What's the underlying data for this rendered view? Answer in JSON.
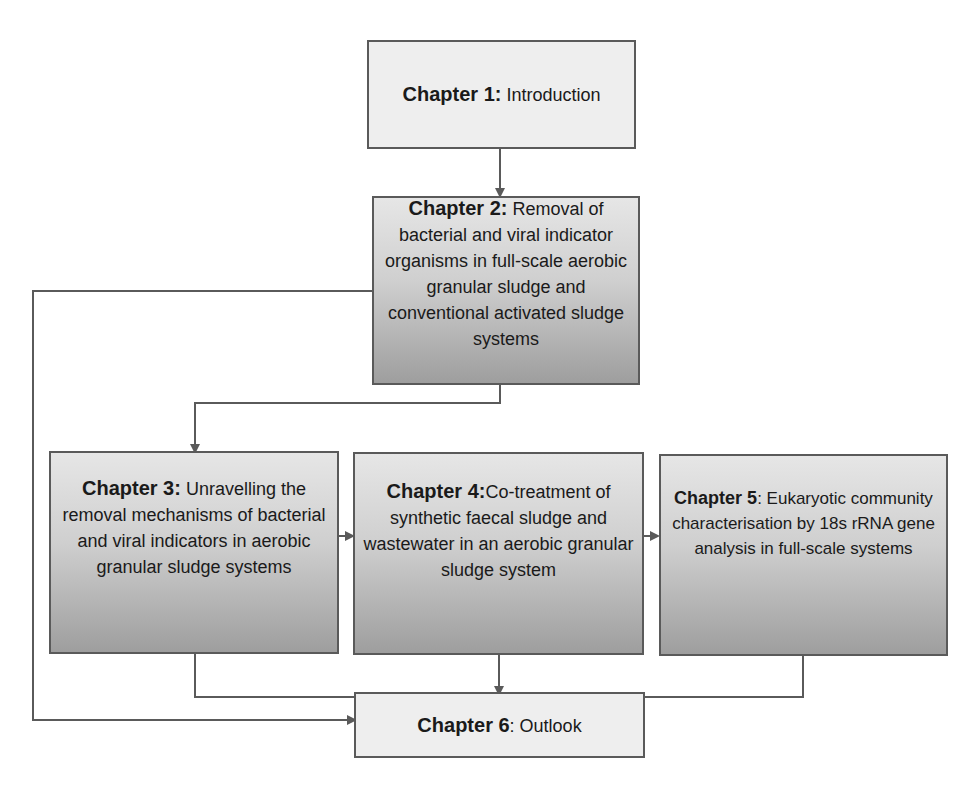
{
  "diagram": {
    "type": "flowchart",
    "nodes": [
      {
        "id": "ch1",
        "title": "Chapter 1:",
        "text": " Introduction"
      },
      {
        "id": "ch2",
        "title": "Chapter 2:",
        "text": " Removal of bacterial and viral indicator organisms in full-scale aerobic granular sludge and conventional activated sludge systems"
      },
      {
        "id": "ch3",
        "title": "Chapter 3:",
        "text": " Unravelling the removal mechanisms of bacterial and viral indicators in aerobic granular sludge systems"
      },
      {
        "id": "ch4",
        "title": "Chapter 4:",
        "text": "Co-treatment of synthetic faecal sludge and wastewater in an aerobic granular sludge system"
      },
      {
        "id": "ch5",
        "title": "Chapter 5",
        "text": ": Eukaryotic community characterisation by 18s rRNA gene analysis in full-scale systems"
      },
      {
        "id": "ch6",
        "title": "Chapter 6",
        "text": ": Outlook"
      }
    ],
    "edges": [
      {
        "from": "ch1",
        "to": "ch2"
      },
      {
        "from": "ch2",
        "to": "ch3"
      },
      {
        "from": "ch2",
        "to": "ch6"
      },
      {
        "from": "ch3",
        "to": "ch4"
      },
      {
        "from": "ch4",
        "to": "ch5"
      },
      {
        "from": "ch3",
        "to": "ch6"
      },
      {
        "from": "ch4",
        "to": "ch6"
      },
      {
        "from": "ch5",
        "to": "ch6"
      }
    ],
    "colors": {
      "line": "#5a5a5a",
      "light_fill": "#eeeeee",
      "gradient_top": "#e6e6e6",
      "gradient_bottom": "#9e9e9e"
    }
  }
}
